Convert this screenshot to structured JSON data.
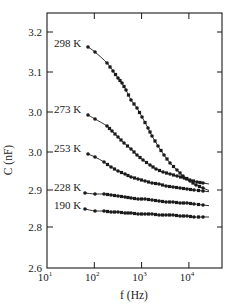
{
  "chart_data": {
    "type": "scatter",
    "title": "",
    "xlabel": "f (Hz)",
    "ylabel": "C (nF)",
    "xscale": "log",
    "xlim": [
      10,
      50000
    ],
    "x_ticks": [
      {
        "value": 10,
        "base": "10",
        "exp": "1"
      },
      {
        "value": 100,
        "base": "10",
        "exp": "2"
      },
      {
        "value": 1000,
        "base": "10",
        "exp": "3"
      },
      {
        "value": 10000,
        "base": "10",
        "exp": "4"
      }
    ],
    "y_ticks": [
      {
        "label": "3.2",
        "py": 32
      },
      {
        "label": "3.1",
        "py": 72
      },
      {
        "label": "3.0",
        "py": 112
      },
      {
        "label": "3.0",
        "py": 152
      },
      {
        "label": "2.9",
        "py": 190
      },
      {
        "label": "2.8",
        "py": 227
      },
      {
        "label": "2.6",
        "py": 268
      }
    ],
    "grid": false,
    "legend": "inline labels at left of each curve",
    "series": [
      {
        "name": "298 K",
        "label_py": 43,
        "f": [
          80,
          100,
          180,
          250,
          320,
          400,
          500,
          650,
          850,
          1000,
          1400,
          1700,
          2300,
          3000,
          4000,
          5500,
          7500,
          10500,
          14000,
          20000
        ],
        "C": [
          3.16,
          3.15,
          3.12,
          3.1,
          3.085,
          3.07,
          3.055,
          3.03,
          3.01,
          2.99,
          2.96,
          2.94,
          2.915,
          2.89,
          2.87,
          2.85,
          2.835,
          2.82,
          2.81,
          2.8
        ]
      },
      {
        "name": "273 K",
        "label_py": 109,
        "f": [
          80,
          100,
          180,
          240,
          320,
          420,
          600,
          800,
          1050,
          1400,
          1900,
          2700,
          3700,
          5000,
          7000,
          10000,
          14000,
          20000
        ],
        "C": [
          3.0,
          2.99,
          2.97,
          2.96,
          2.945,
          2.93,
          2.915,
          2.9,
          2.885,
          2.87,
          2.86,
          2.85,
          2.845,
          2.84,
          2.835,
          2.83,
          2.825,
          2.82
        ]
      },
      {
        "name": "253 K",
        "label_py": 148,
        "f": [
          80,
          100,
          160,
          220,
          320,
          440,
          600,
          850,
          1200,
          1650,
          2300,
          3200,
          4500,
          6300,
          8800,
          12000,
          20000
        ],
        "C": [
          2.91,
          2.905,
          2.89,
          2.88,
          2.87,
          2.862,
          2.855,
          2.85,
          2.845,
          2.84,
          2.837,
          2.833,
          2.83,
          2.827,
          2.825,
          2.822,
          2.82
        ]
      },
      {
        "name": "228 K",
        "label_py": 187,
        "f": [
          70,
          100,
          160,
          220,
          320,
          440,
          600,
          850,
          1200,
          1650,
          2300,
          3200,
          4500,
          6300,
          8800,
          12000,
          20000
        ],
        "C": [
          2.9,
          2.897,
          2.897,
          2.895,
          2.892,
          2.89,
          2.887,
          2.884,
          2.884,
          2.881,
          2.879,
          2.876,
          2.876,
          2.873,
          2.873,
          2.871,
          2.868
        ]
      },
      {
        "name": "190 K",
        "label_py": 205,
        "f": [
          70,
          100,
          160,
          220,
          320,
          440,
          600,
          850,
          1200,
          1650,
          2300,
          3200,
          4500,
          6300,
          8800,
          12000,
          20000
        ],
        "C": [
          2.84,
          2.835,
          2.835,
          2.832,
          2.832,
          2.83,
          2.83,
          2.827,
          2.827,
          2.827,
          2.824,
          2.824,
          2.824,
          2.822,
          2.822,
          2.819,
          2.819
        ]
      }
    ],
    "pixel_series": [
      {
        "name": "298 K",
        "points": [
          [
            88,
            47
          ],
          [
            95,
            52
          ],
          [
            107,
            63
          ],
          [
            113,
            71
          ],
          [
            118,
            78
          ],
          [
            122,
            83
          ],
          [
            126,
            90
          ],
          [
            131,
            100
          ],
          [
            137,
            108
          ],
          [
            142,
            117
          ],
          [
            148,
            128
          ],
          [
            152,
            136
          ],
          [
            158,
            146
          ],
          [
            164,
            155
          ],
          [
            170,
            163
          ],
          [
            177,
            170
          ],
          [
            183,
            176
          ],
          [
            190,
            181
          ],
          [
            196,
            185
          ],
          [
            203,
            188
          ]
        ]
      },
      {
        "name": "273 K",
        "points": [
          [
            88,
            115
          ],
          [
            95,
            119
          ],
          [
            107,
            126
          ],
          [
            112,
            131
          ],
          [
            118,
            137
          ],
          [
            124,
            143
          ],
          [
            131,
            149
          ],
          [
            137,
            155
          ],
          [
            143,
            160
          ],
          [
            150,
            165
          ],
          [
            156,
            169
          ],
          [
            163,
            172
          ],
          [
            170,
            174
          ],
          [
            177,
            176
          ],
          [
            184,
            178
          ],
          [
            190,
            180
          ],
          [
            197,
            182
          ],
          [
            203,
            183
          ]
        ]
      },
      {
        "name": "253 K",
        "points": [
          [
            88,
            154
          ],
          [
            95,
            157
          ],
          [
            104,
            162
          ],
          [
            111,
            167
          ],
          [
            118,
            171
          ],
          [
            125,
            174
          ],
          [
            131,
            177
          ],
          [
            138,
            179
          ],
          [
            145,
            181
          ],
          [
            152,
            183
          ],
          [
            159,
            184
          ],
          [
            166,
            186
          ],
          [
            173,
            187
          ],
          [
            180,
            188
          ],
          [
            187,
            189
          ],
          [
            194,
            190
          ],
          [
            203,
            191
          ]
        ]
      },
      {
        "name": "228 K",
        "points": [
          [
            85,
            193
          ],
          [
            95,
            194
          ],
          [
            104,
            194
          ],
          [
            111,
            195
          ],
          [
            118,
            196
          ],
          [
            125,
            197
          ],
          [
            131,
            198
          ],
          [
            138,
            199
          ],
          [
            145,
            199
          ],
          [
            152,
            200
          ],
          [
            159,
            201
          ],
          [
            166,
            202
          ],
          [
            173,
            202
          ],
          [
            180,
            203
          ],
          [
            187,
            203
          ],
          [
            194,
            204
          ],
          [
            203,
            205
          ]
        ]
      },
      {
        "name": "190 K",
        "points": [
          [
            85,
            209
          ],
          [
            95,
            211
          ],
          [
            104,
            211
          ],
          [
            111,
            212
          ],
          [
            118,
            212
          ],
          [
            125,
            213
          ],
          [
            131,
            213
          ],
          [
            138,
            214
          ],
          [
            145,
            214
          ],
          [
            152,
            214
          ],
          [
            159,
            215
          ],
          [
            166,
            215
          ],
          [
            173,
            215
          ],
          [
            180,
            216
          ],
          [
            187,
            216
          ],
          [
            194,
            217
          ],
          [
            203,
            217
          ]
        ]
      }
    ]
  },
  "axes": {
    "x_title": "f (Hz)",
    "y_title": "C (nF)"
  },
  "colors": {
    "ink": "#1a1a1a",
    "background": "#ffffff"
  }
}
